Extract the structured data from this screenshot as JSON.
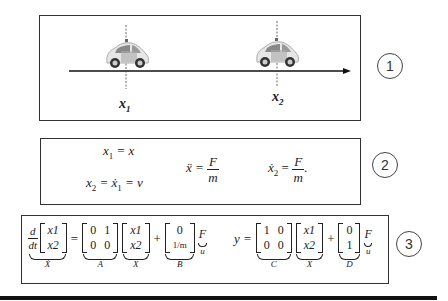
{
  "panel1": {
    "label_x1": "x",
    "label_x1_sub": "1",
    "label_x2": "x",
    "label_x2_sub": "2",
    "circle": "1",
    "cars": [
      {
        "name": "car-1",
        "position_label": "x1"
      },
      {
        "name": "car-2",
        "position_label": "x2"
      }
    ]
  },
  "panel2": {
    "eq1": {
      "lhs": "x",
      "lhs_sub": "1",
      "rhs": "= x"
    },
    "eq2": {
      "lhs": "x",
      "lhs_sub": "2",
      "mid": "= ẋ",
      "mid_sub": "1",
      "rhs": "= v"
    },
    "eq3": {
      "lhs": "ẍ =",
      "num": "F",
      "den": "m"
    },
    "eq4": {
      "lhs": "ẋ",
      "lhs_sub": "2",
      "eq": "=",
      "num": "F",
      "den": "m",
      "tail": "."
    },
    "circle": "2"
  },
  "panel3": {
    "state_eq": {
      "deriv_num": "d",
      "deriv_den": "dt",
      "state_vec": [
        "x1",
        "x2"
      ],
      "state_label": "Ẋ",
      "A": [
        [
          "0",
          "1"
        ],
        [
          "0",
          "0"
        ]
      ],
      "A_label": "A",
      "X": [
        "x1",
        "x2"
      ],
      "X_label": "X",
      "plus": "+",
      "B": [
        "0",
        "1/m"
      ],
      "B_label": "B",
      "input": "F",
      "input_label": "u"
    },
    "output_eq": {
      "lhs": "y =",
      "C": [
        [
          "1",
          "0"
        ],
        [
          "0",
          "0"
        ]
      ],
      "C_label": "C",
      "X": [
        "x1",
        "x2"
      ],
      "X_label": "X",
      "plus": "+",
      "D": [
        "0",
        "1"
      ],
      "D_label": "D",
      "input": "F",
      "input_label": "u"
    },
    "circle": "3"
  }
}
